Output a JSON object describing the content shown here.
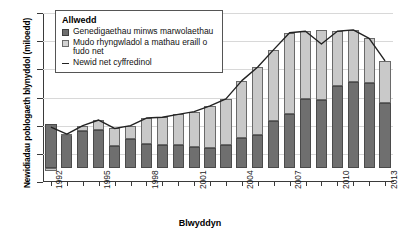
{
  "chart_data": {
    "type": "bar",
    "stacked": true,
    "title": "",
    "xlabel": "Blwyddyn",
    "ylabel": "Newidiadau poblogaeth blynyddol (miloedd)",
    "ylim": [
      -50,
      550
    ],
    "yticks": [
      -50,
      50,
      150,
      250,
      350,
      450,
      550
    ],
    "grid": true,
    "legend_position": "top-left",
    "legend_title": "Allwedd",
    "categories": [
      1992,
      1993,
      1994,
      1995,
      1996,
      1997,
      1998,
      1999,
      2000,
      2001,
      2002,
      2003,
      2004,
      2005,
      2006,
      2007,
      2008,
      2009,
      2010,
      2011,
      2012,
      2013
    ],
    "xtick_labels": [
      "1992",
      "1995",
      "1998",
      "2001",
      "2004",
      "2007",
      "2010",
      "2013"
    ],
    "series": [
      {
        "name": "Genedigaethau minws marwolaethau",
        "color": "#6f6f6f",
        "values": [
          155,
          120,
          130,
          135,
          78,
          103,
          85,
          80,
          80,
          75,
          72,
          80,
          105,
          118,
          165,
          190,
          245,
          240,
          290,
          305,
          300,
          230
        ]
      },
      {
        "name": "Mudo rhyngwladol a mathau eraill o fudo net",
        "color": "#c9c9c9",
        "values": [
          -10,
          0,
          20,
          35,
          62,
          47,
          92,
          100,
          110,
          125,
          148,
          165,
          205,
          240,
          255,
          290,
          240,
          250,
          195,
          185,
          160,
          150
        ]
      }
    ],
    "line_series": {
      "name": "Newid net cyffredinol",
      "color": "#222222",
      "values": [
        145,
        120,
        150,
        170,
        140,
        150,
        177,
        180,
        190,
        200,
        220,
        245,
        310,
        358,
        420,
        480,
        485,
        440,
        485,
        490,
        460,
        380
      ]
    }
  },
  "legend": {
    "title": "Allwedd",
    "items": [
      {
        "label": "Genedigaethau minws marwolaethau",
        "swatch": "dark-grey-square"
      },
      {
        "label": "Mudo rhyngwladol a mathau eraill o fudo net",
        "swatch": "light-grey-square"
      },
      {
        "label": "Newid net cyffredinol",
        "swatch": "black-line"
      }
    ]
  }
}
